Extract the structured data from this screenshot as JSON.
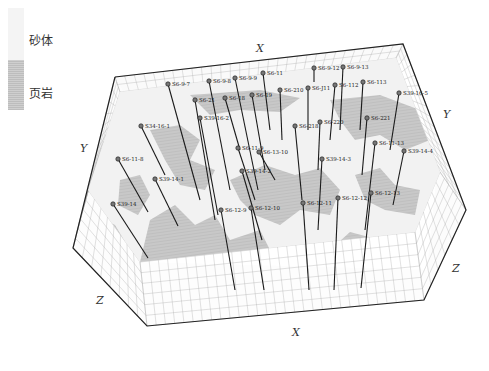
{
  "legend": {
    "items": [
      {
        "label": "砂体",
        "color": "#f4f4f4"
      },
      {
        "label": "页岩",
        "color": "#c6c6c6"
      }
    ]
  },
  "axes": {
    "x_top": "X",
    "x_bottom": "X",
    "y_left": "Y",
    "y_right": "Y",
    "z_left": "Z",
    "z_right": "Z"
  },
  "colors": {
    "sand": "#f4f4f4",
    "shale": "#c4c4c4",
    "grid": "#9a9a9a",
    "frame": "#222222",
    "well": "#1a1a1a"
  },
  "wells": [
    {
      "label": "S6-9-7",
      "x": 168,
      "y": 84,
      "x2": 200,
      "y2": 200
    },
    {
      "label": "S6-9-8",
      "x": 209,
      "y": 81,
      "x2": 230,
      "y2": 190
    },
    {
      "label": "S6-9-9",
      "x": 235,
      "y": 78,
      "x2": 258,
      "y2": 190
    },
    {
      "label": "S6-11",
      "x": 263,
      "y": 73,
      "x2": 270,
      "y2": 130
    },
    {
      "label": "S6-9-12",
      "x": 314,
      "y": 68,
      "x2": 314,
      "y2": 82
    },
    {
      "label": "S6-9-13",
      "x": 343,
      "y": 67,
      "x2": 340,
      "y2": 130
    },
    {
      "label": "S6-21",
      "x": 195,
      "y": 100,
      "x2": 215,
      "y2": 220
    },
    {
      "label": "S6-18",
      "x": 225,
      "y": 98,
      "x2": 240,
      "y2": 150
    },
    {
      "label": "S6-19",
      "x": 252,
      "y": 95,
      "x2": 265,
      "y2": 170
    },
    {
      "label": "S6-210",
      "x": 280,
      "y": 90,
      "x2": 282,
      "y2": 140
    },
    {
      "label": "S6-J11",
      "x": 308,
      "y": 88,
      "x2": 308,
      "y2": 130
    },
    {
      "label": "S6-112",
      "x": 335,
      "y": 85,
      "x2": 330,
      "y2": 140
    },
    {
      "label": "S6-113",
      "x": 363,
      "y": 82,
      "x2": 360,
      "y2": 130
    },
    {
      "label": "S39-16-5",
      "x": 399,
      "y": 93,
      "x2": 390,
      "y2": 150
    },
    {
      "label": "S34-16-1",
      "x": 141,
      "y": 126,
      "x2": 165,
      "y2": 175
    },
    {
      "label": "S39-16-2",
      "x": 200,
      "y": 118,
      "x2": 218,
      "y2": 215
    },
    {
      "label": "S6-11-9",
      "x": 238,
      "y": 148,
      "x2": 255,
      "y2": 200
    },
    {
      "label": "S6-13-10",
      "x": 259,
      "y": 152,
      "x2": 275,
      "y2": 180
    },
    {
      "label": "S6-218",
      "x": 295,
      "y": 126,
      "x2": 302,
      "y2": 200
    },
    {
      "label": "S6-220",
      "x": 320,
      "y": 122,
      "x2": 318,
      "y2": 170
    },
    {
      "label": "S6-221",
      "x": 367,
      "y": 118,
      "x2": 362,
      "y2": 175
    },
    {
      "label": "S6-11-8",
      "x": 118,
      "y": 159,
      "x2": 148,
      "y2": 212
    },
    {
      "label": "S39-14-1",
      "x": 155,
      "y": 179,
      "x2": 178,
      "y2": 226
    },
    {
      "label": "S39-14-2",
      "x": 242,
      "y": 171,
      "x2": 262,
      "y2": 240
    },
    {
      "label": "S39-14-3",
      "x": 322,
      "y": 159,
      "x2": 318,
      "y2": 230
    },
    {
      "label": "S6-11-13",
      "x": 375,
      "y": 143,
      "x2": 365,
      "y2": 230
    },
    {
      "label": "S39-14-4",
      "x": 404,
      "y": 151,
      "x2": 393,
      "y2": 205
    },
    {
      "label": "S39-14",
      "x": 113,
      "y": 204,
      "x2": 148,
      "y2": 258
    },
    {
      "label": "S6-12-9",
      "x": 221,
      "y": 210,
      "x2": 235,
      "y2": 290
    },
    {
      "label": "S6-12-10",
      "x": 251,
      "y": 208,
      "x2": 264,
      "y2": 290
    },
    {
      "label": "S6-12-11",
      "x": 303,
      "y": 203,
      "x2": 309,
      "y2": 290
    },
    {
      "label": "S6-12-12",
      "x": 338,
      "y": 198,
      "x2": 334,
      "y2": 290
    },
    {
      "label": "S6-12-13",
      "x": 371,
      "y": 193,
      "x2": 361,
      "y2": 288
    }
  ]
}
